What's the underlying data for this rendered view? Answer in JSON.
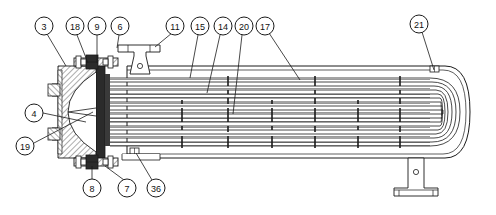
{
  "drawing": {
    "title": "U-tube shell-and-tube heat exchanger assembly cross-section",
    "type": "technical-assembly-drawing",
    "width": 496,
    "height": 215,
    "background_color": "#ffffff",
    "line_color": "#1a1a1a",
    "hatch_color": "#808080",
    "dark_fill_color": "#2b2b2b"
  },
  "callouts": {
    "top": [
      {
        "id": "3",
        "label": "3",
        "cx": 44,
        "cy": 26,
        "lx": 66,
        "ly": 66
      },
      {
        "id": "18",
        "label": "18",
        "cx": 75,
        "cy": 26,
        "lx": 88,
        "ly": 63
      },
      {
        "id": "9",
        "label": "9",
        "cx": 97,
        "cy": 26,
        "lx": 97,
        "ly": 63
      },
      {
        "id": "6",
        "label": "6",
        "cx": 120,
        "cy": 26,
        "lx": 117,
        "ly": 48
      },
      {
        "id": "11",
        "label": "11",
        "cx": 175,
        "cy": 26,
        "lx": 155,
        "ly": 47
      },
      {
        "id": "15",
        "label": "15",
        "cx": 200,
        "cy": 26,
        "lx": 190,
        "ly": 78
      },
      {
        "id": "14",
        "label": "14",
        "cx": 223,
        "cy": 26,
        "lx": 207,
        "ly": 93
      },
      {
        "id": "20",
        "label": "20",
        "cx": 244,
        "cy": 26,
        "lx": 233,
        "ly": 114
      },
      {
        "id": "17",
        "label": "17",
        "cx": 265,
        "cy": 26,
        "lx": 300,
        "ly": 80
      },
      {
        "id": "21",
        "label": "21",
        "cx": 419,
        "cy": 24,
        "lx": 434,
        "ly": 72
      }
    ],
    "left": [
      {
        "id": "4",
        "label": "4",
        "cx": 34,
        "cy": 113,
        "lx": 86,
        "ly": 122
      },
      {
        "id": "19",
        "label": "19",
        "cx": 25,
        "cy": 146,
        "lx": 93,
        "ly": 112
      }
    ],
    "bottom": [
      {
        "id": "8",
        "label": "8",
        "cx": 92,
        "cy": 188,
        "lx": 92,
        "ly": 163
      },
      {
        "id": "7",
        "label": "7",
        "cx": 127,
        "cy": 188,
        "lx": 105,
        "ly": 164
      },
      {
        "id": "36",
        "label": "36",
        "cx": 156,
        "cy": 188,
        "lx": 136,
        "ly": 152
      }
    ]
  },
  "geometry": {
    "balloon_radius": 9,
    "shell": {
      "x_left": 127,
      "x_right": 470,
      "y_top": 66,
      "y_bottom": 158
    },
    "tube_count": 12,
    "baffle_positions": [
      182,
      228,
      272,
      315,
      358,
      400
    ],
    "supports": [
      {
        "name": "lifting-lug-left",
        "x": 130,
        "y": 44
      },
      {
        "name": "saddle-support-right",
        "x": 415,
        "y": 158
      }
    ]
  }
}
